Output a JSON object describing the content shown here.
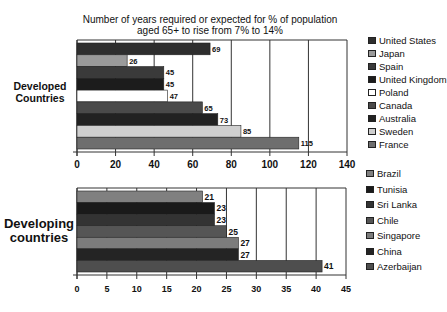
{
  "chart_data": [
    {
      "type": "bar",
      "orientation": "horizontal",
      "title": "Number of years required or expected for % of population aged 65+ to rise from 7% to 14%",
      "group_label": "Developed Countries",
      "categories": [
        "United States",
        "Japan",
        "Spain",
        "United Kingdom",
        "Poland",
        "Canada",
        "Australia",
        "Sweden",
        "France"
      ],
      "values": [
        69,
        26,
        45,
        45,
        47,
        65,
        73,
        85,
        115
      ],
      "colors": [
        "#2e2e2e",
        "#9a9a9a",
        "#3a3a3a",
        "#1c1c1c",
        "#ffffff",
        "#4a4a4a",
        "#222222",
        "#cfcfcf",
        "#6e6e6e"
      ],
      "xlim": [
        0,
        140
      ],
      "xticks": [
        "0",
        "20",
        "40",
        "60",
        "80",
        "100",
        "120",
        "140"
      ],
      "grid": true,
      "legend": "right"
    },
    {
      "type": "bar",
      "orientation": "horizontal",
      "group_label": "Developing countries",
      "categories": [
        "Brazil",
        "Tunisia",
        "Sri Lanka",
        "Chile",
        "Singapore",
        "China",
        "Azerbaijan"
      ],
      "values": [
        21,
        23,
        23,
        25,
        27,
        27,
        41
      ],
      "colors": [
        "#808080",
        "#1a1a1a",
        "#333333",
        "#555555",
        "#7c7c7c",
        "#242424",
        "#4e4e4e"
      ],
      "xlim": [
        0,
        45
      ],
      "xticks": [
        "0",
        "5",
        "10",
        "15",
        "20",
        "25",
        "30",
        "35",
        "40",
        "45"
      ],
      "grid": true,
      "legend": "right"
    }
  ],
  "title_line1": "Number of years required or expected for % of population",
  "title_line2": "aged 65+ to rise from 7% to 14%",
  "top_group_line1": "Developed",
  "top_group_line2": "Countries",
  "bottom_group_line1": "Developing",
  "bottom_group_line2": "countries"
}
